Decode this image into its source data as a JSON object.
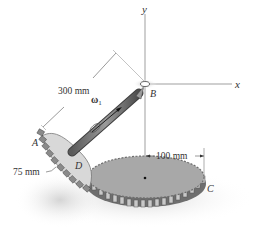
{
  "figure": {
    "axes": {
      "x_label": "x",
      "y_label": "y"
    },
    "points": {
      "A": "A",
      "B": "B",
      "C": "C",
      "D": "D"
    },
    "dimensions": {
      "shaft_length": "300 mm",
      "small_gear_radius": "75 mm",
      "large_gear_radius": "100 mm"
    },
    "angular_velocity": {
      "symbol": "ω",
      "subscript": "1"
    },
    "colors": {
      "gear_face": "#a9a9a9",
      "gear_teeth": "#7a7a7a",
      "small_gear_face": "#d6d6d6",
      "shaft": "#6f6f6f",
      "axis_line": "#666666",
      "shadow": "#e4e4e4"
    }
  }
}
